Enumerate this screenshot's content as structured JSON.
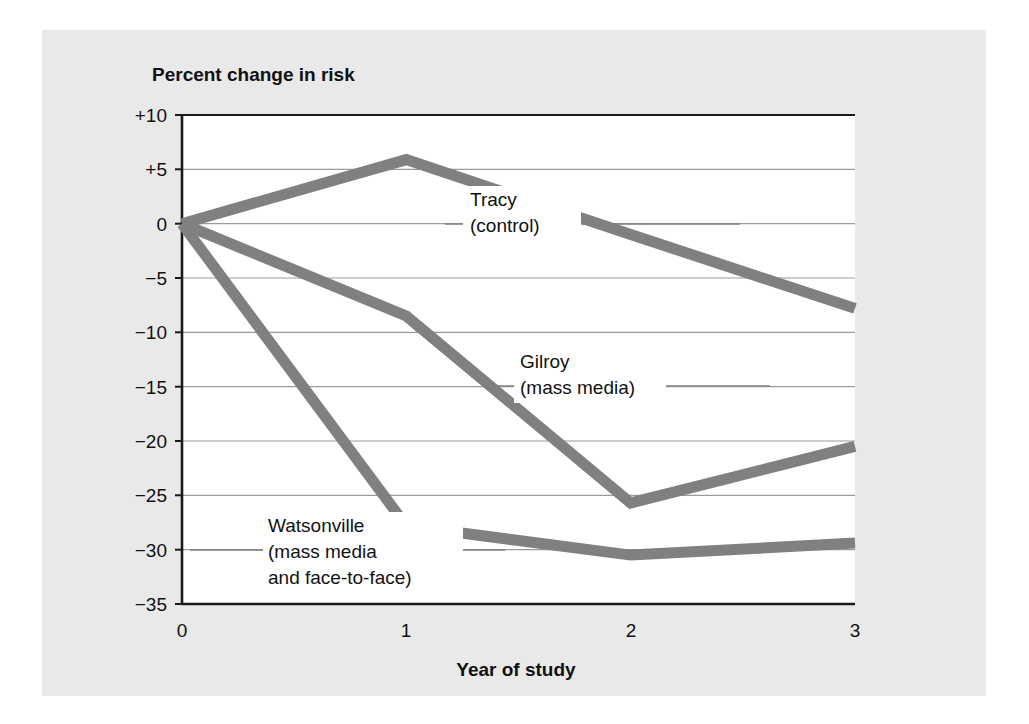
{
  "chart_data": {
    "type": "line",
    "title": "",
    "ylabel": "Percent change in risk",
    "xlabel": "Year of study",
    "x": [
      0,
      1,
      2,
      3
    ],
    "xticklabels": [
      "0",
      "1",
      "2",
      "3"
    ],
    "xlim": [
      0,
      3
    ],
    "ylim": [
      -35,
      10
    ],
    "yticks": [
      10,
      5,
      0,
      -5,
      -10,
      -15,
      -20,
      -25,
      -30,
      -35
    ],
    "yticklabels": [
      "+10",
      "+5",
      "0",
      "−5",
      "−10",
      "−15",
      "−20",
      "−25",
      "−30",
      "−35"
    ],
    "grid": true,
    "legend_position": "inline-annotations",
    "series": [
      {
        "name": "Tracy (control)",
        "label_lines": [
          "Tracy",
          "(control)"
        ],
        "values": [
          0,
          5.9,
          -1.0,
          -7.8
        ],
        "color": "#808080"
      },
      {
        "name": "Gilroy (mass media)",
        "label_lines": [
          "Gilroy",
          "(mass media)"
        ],
        "values": [
          0,
          -8.5,
          -25.7,
          -20.5
        ],
        "color": "#808080"
      },
      {
        "name": "Watsonville (mass media and face-to-face)",
        "label_lines": [
          "Watsonville",
          "(mass media",
          "and face-to-face)"
        ],
        "values": [
          0,
          -27.8,
          -30.5,
          -29.4
        ],
        "color": "#808080"
      }
    ]
  },
  "colors": {
    "page_background": "#ffffff",
    "panel_background": "#e9e9e9",
    "plot_background": "#ffffff",
    "line": "#808080",
    "axis": "#1a1a1a",
    "grid": "#9a9a9a",
    "text": "#111111"
  },
  "annotations": {
    "tracy": {
      "line1": "Tracy",
      "line2": "(control)"
    },
    "gilroy": {
      "line1": "Gilroy",
      "line2": "(mass media)"
    },
    "watsonville": {
      "line1": "Watsonville",
      "line2": "(mass media",
      "line3": "and face-to-face)"
    }
  },
  "axes": {
    "ylabel": "Percent change in risk",
    "xlabel": "Year of study",
    "yticks": {
      "t0": "+10",
      "t1": "+5",
      "t2": "0",
      "t3": "−5",
      "t4": "−10",
      "t5": "−15",
      "t6": "−20",
      "t7": "−25",
      "t8": "−30",
      "t9": "−35"
    },
    "xticks": {
      "t0": "0",
      "t1": "1",
      "t2": "2",
      "t3": "3"
    }
  }
}
